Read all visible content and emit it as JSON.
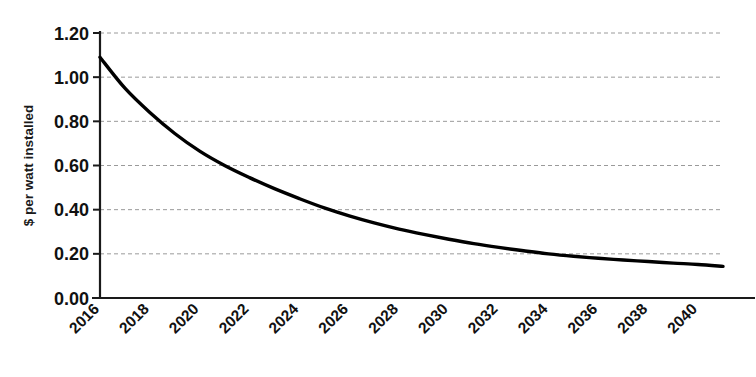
{
  "chart_data": {
    "type": "line",
    "title": "",
    "xlabel": "",
    "ylabel": "$ per watt installed",
    "xlim": [
      2016,
      2041
    ],
    "ylim": [
      0.0,
      1.2
    ],
    "grid": true,
    "legend": false,
    "legend_position": "none",
    "line_color": "#000000",
    "grid_color": "#9a9a9a",
    "axis_color": "#1a1a1a",
    "background_color": "#ffffff",
    "x_tick_labels": [
      "2016",
      "2018",
      "2020",
      "2022",
      "2024",
      "2026",
      "2028",
      "2030",
      "2032",
      "2034",
      "2036",
      "2038",
      "2040"
    ],
    "x_tick_values": [
      2016,
      2018,
      2020,
      2022,
      2024,
      2026,
      2028,
      2030,
      2032,
      2034,
      2036,
      2038,
      2040
    ],
    "x_tick_rotation": -45,
    "y_tick_labels": [
      "0.00",
      "0.20",
      "0.40",
      "0.60",
      "0.80",
      "1.00",
      "1.20"
    ],
    "y_tick_values": [
      0.0,
      0.2,
      0.4,
      0.6,
      0.8,
      1.0,
      1.2
    ],
    "series": [
      {
        "name": "$ per watt installed",
        "x": [
          2016,
          2017,
          2018,
          2019,
          2020,
          2021,
          2022,
          2023,
          2024,
          2025,
          2026,
          2027,
          2028,
          2029,
          2030,
          2031,
          2032,
          2033,
          2034,
          2035,
          2036,
          2037,
          2038,
          2039,
          2040,
          2041
        ],
        "values": [
          1.09,
          0.95,
          0.84,
          0.745,
          0.665,
          0.6,
          0.545,
          0.495,
          0.45,
          0.408,
          0.372,
          0.34,
          0.312,
          0.288,
          0.266,
          0.246,
          0.229,
          0.214,
          0.2,
          0.189,
          0.18,
          0.172,
          0.165,
          0.158,
          0.152,
          0.143
        ]
      }
    ],
    "annotations": []
  },
  "geometry": {
    "plot_left": 100,
    "plot_right": 723,
    "plot_top": 33,
    "plot_bottom": 298
  }
}
